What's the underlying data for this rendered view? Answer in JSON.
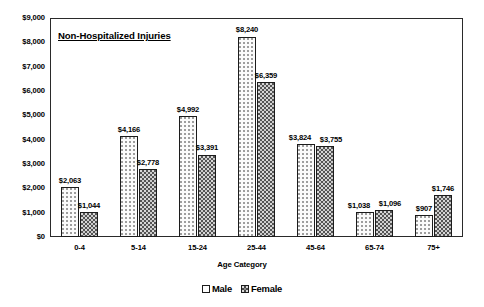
{
  "chart_data": {
    "type": "bar",
    "title": "Non-Hospitalized Injuries",
    "xlabel": "Age Category",
    "ylabel": "",
    "ylim": [
      0,
      9000
    ],
    "ytick_step": 1000,
    "grid": false,
    "legend_position": "bottom",
    "categories": [
      "0-4",
      "5-14",
      "15-24",
      "25-44",
      "45-64",
      "65-74",
      "75+"
    ],
    "ytick_labels": [
      "$0",
      "$1,000",
      "$2,000",
      "$3,000",
      "$4,000",
      "$5,000",
      "$6,000",
      "$7,000",
      "$8,000",
      "$9,000"
    ],
    "ytick_values": [
      0,
      1000,
      2000,
      3000,
      4000,
      5000,
      6000,
      7000,
      8000,
      9000
    ],
    "series": [
      {
        "name": "Male",
        "values": [
          2063,
          4166,
          4992,
          8240,
          3824,
          1038,
          907
        ],
        "labels": [
          "$2,063",
          "$4,166",
          "$4,992",
          "$8,240",
          "$3,824",
          "$1,038",
          "$907"
        ]
      },
      {
        "name": "Female",
        "values": [
          1044,
          2778,
          3391,
          6359,
          3755,
          1096,
          1746
        ],
        "labels": [
          "$1,044",
          "$2,778",
          "$3,391",
          "$6,359",
          "$3,755",
          "$1,096",
          "$1,746"
        ]
      }
    ]
  },
  "legend": {
    "entries": [
      {
        "label": "Male",
        "swatch": "light-dotted-square"
      },
      {
        "label": "Female",
        "swatch": "dark-checkered-square"
      }
    ]
  },
  "colors": {
    "axis": "#2a2a2a",
    "male_fill": "#fbfbfb",
    "female_fill": "#545454",
    "text": "#000000",
    "background": "#ffffff"
  }
}
